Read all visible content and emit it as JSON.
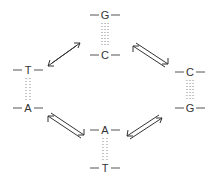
{
  "diagram": {
    "type": "tautomeric base-pair transitions cycle",
    "pairs": [
      {
        "id": "top",
        "upper": "G",
        "lower": "C",
        "x": 105,
        "y_upper": 18,
        "y_lower": 55
      },
      {
        "id": "left",
        "upper": "T",
        "lower": "A",
        "x": 28,
        "y_upper": 72,
        "y_lower": 108
      },
      {
        "id": "right",
        "upper": "C",
        "lower": "G",
        "x": 190,
        "y_upper": 72,
        "y_lower": 108
      },
      {
        "id": "bottom",
        "upper": "A",
        "lower": "T",
        "x": 105,
        "y_upper": 130,
        "y_lower": 168
      }
    ],
    "equilibria": [
      {
        "from": "left",
        "to": "top",
        "symbol": "⇌"
      },
      {
        "from": "top",
        "to": "right",
        "symbol": "⇌"
      },
      {
        "from": "left",
        "to": "bottom",
        "symbol": "⇌"
      },
      {
        "from": "bottom",
        "to": "right",
        "symbol": "⇌"
      }
    ],
    "colors": {
      "text": "#333333",
      "strand": "#555555",
      "bond": "#888888",
      "background": "#ffffff"
    }
  },
  "labels": {
    "top_upper": "G",
    "top_lower": "C",
    "left_upper": "T",
    "left_lower": "A",
    "right_upper": "C",
    "right_lower": "G",
    "bottom_upper": "A",
    "bottom_lower": "T"
  }
}
